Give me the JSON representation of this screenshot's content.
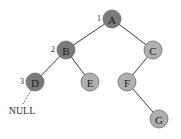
{
  "diagram": {
    "type": "binary-tree",
    "colors": {
      "visited": "#7a7a7a",
      "unvisited": "#b0b0b0",
      "edge": "#3a3a3a"
    },
    "nodes": [
      {
        "id": "A",
        "label": "A",
        "x": 112,
        "y": 19,
        "visited": true,
        "order": "1"
      },
      {
        "id": "B",
        "label": "B",
        "x": 66,
        "y": 50,
        "visited": true,
        "order": "2"
      },
      {
        "id": "C",
        "label": "C",
        "x": 153,
        "y": 50,
        "visited": false,
        "order": ""
      },
      {
        "id": "D",
        "label": "D",
        "x": 35,
        "y": 82,
        "visited": true,
        "order": "3"
      },
      {
        "id": "E",
        "label": "E",
        "x": 90,
        "y": 82,
        "visited": false,
        "order": ""
      },
      {
        "id": "F",
        "label": "F",
        "x": 127,
        "y": 82,
        "visited": false,
        "order": ""
      },
      {
        "id": "G",
        "label": "G",
        "x": 159,
        "y": 119,
        "visited": false,
        "order": ""
      }
    ],
    "edges": [
      {
        "from": "A",
        "to": "B"
      },
      {
        "from": "A",
        "to": "C"
      },
      {
        "from": "B",
        "to": "D"
      },
      {
        "from": "B",
        "to": "E"
      },
      {
        "from": "C",
        "to": "F"
      },
      {
        "from": "F",
        "to": "G"
      }
    ],
    "null_pointer": {
      "from": "D",
      "label": "NULL"
    }
  }
}
